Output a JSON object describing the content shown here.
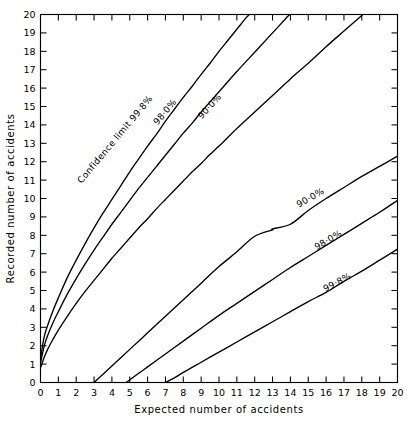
{
  "chart_data": {
    "type": "line",
    "title": "",
    "xlabel": "Expected number of accidents",
    "ylabel": "Recorded number of accidents",
    "xlim": [
      0,
      20
    ],
    "ylim": [
      0,
      20
    ],
    "xticks": [
      0,
      1,
      2,
      3,
      4,
      5,
      6,
      7,
      8,
      9,
      10,
      11,
      12,
      13,
      14,
      15,
      16,
      17,
      18,
      19,
      20
    ],
    "yticks": [
      0,
      1,
      2,
      3,
      4,
      5,
      6,
      7,
      8,
      9,
      10,
      11,
      12,
      13,
      14,
      15,
      16,
      17,
      18,
      19,
      20
    ],
    "xticklabels": [
      "0",
      "1",
      "2",
      "3",
      "4",
      "5",
      "6",
      "7",
      "8",
      "9",
      "10",
      "11",
      "12",
      "13",
      "14",
      "15",
      "16",
      "17",
      "18",
      "19",
      "20"
    ],
    "yticklabels": [
      "0",
      "1",
      "2",
      "3",
      "4",
      "5",
      "6",
      "7",
      "8",
      "9",
      "10",
      "11",
      "12",
      "13",
      "14",
      "15",
      "16",
      "17",
      "18",
      "19",
      "20"
    ],
    "grid": false,
    "legend": "none",
    "ticks_inward": true,
    "line_color": "#000000",
    "background": "#ffffff",
    "series": [
      {
        "name": "upper-99.8",
        "label": "Confidence limit 99·8%",
        "label_x": 4.3,
        "label_y": 13.1,
        "label_angle": -50,
        "points": [
          [
            0.0,
            1.3
          ],
          [
            0.2,
            2.45
          ],
          [
            0.4,
            3.1
          ],
          [
            0.7,
            3.9
          ],
          [
            1.0,
            4.6
          ],
          [
            1.5,
            5.7
          ],
          [
            2.0,
            6.65
          ],
          [
            2.5,
            7.55
          ],
          [
            3.0,
            8.4
          ],
          [
            3.5,
            9.2
          ],
          [
            4.0,
            9.95
          ],
          [
            4.5,
            10.7
          ],
          [
            5.0,
            11.45
          ],
          [
            5.5,
            12.15
          ],
          [
            6.0,
            12.85
          ],
          [
            6.5,
            13.5
          ],
          [
            7.0,
            14.2
          ],
          [
            7.5,
            14.85
          ],
          [
            8.0,
            15.5
          ],
          [
            8.5,
            16.1
          ],
          [
            9.0,
            16.75
          ],
          [
            9.5,
            17.35
          ],
          [
            10.0,
            18.0
          ],
          [
            10.5,
            18.6
          ],
          [
            11.0,
            19.2
          ],
          [
            11.5,
            19.8
          ],
          [
            11.7,
            20.0
          ]
        ]
      },
      {
        "name": "upper-98.0",
        "label": "98·0%",
        "label_x": 7.1,
        "label_y": 14.6,
        "label_angle": -50,
        "points": [
          [
            0.0,
            1.05
          ],
          [
            0.2,
            1.95
          ],
          [
            0.4,
            2.55
          ],
          [
            0.7,
            3.25
          ],
          [
            1.0,
            3.85
          ],
          [
            1.5,
            4.8
          ],
          [
            2.0,
            5.65
          ],
          [
            2.5,
            6.45
          ],
          [
            3.0,
            7.2
          ],
          [
            3.5,
            7.9
          ],
          [
            4.0,
            8.6
          ],
          [
            4.5,
            9.25
          ],
          [
            5.0,
            9.9
          ],
          [
            5.5,
            10.55
          ],
          [
            6.0,
            11.15
          ],
          [
            6.5,
            11.75
          ],
          [
            7.0,
            12.35
          ],
          [
            7.5,
            12.95
          ],
          [
            8.0,
            13.55
          ],
          [
            8.5,
            14.1
          ],
          [
            9.0,
            14.7
          ],
          [
            9.5,
            15.25
          ],
          [
            10.0,
            15.8
          ],
          [
            11.0,
            16.9
          ],
          [
            12.0,
            17.95
          ],
          [
            13.0,
            19.0
          ],
          [
            13.9,
            19.95
          ],
          [
            14.0,
            20.0
          ]
        ]
      },
      {
        "name": "upper-90.0",
        "label": "90·0%",
        "label_x": 9.6,
        "label_y": 14.9,
        "label_angle": -48,
        "points": [
          [
            0.0,
            0.8
          ],
          [
            0.2,
            1.35
          ],
          [
            0.4,
            1.8
          ],
          [
            0.7,
            2.35
          ],
          [
            1.0,
            2.85
          ],
          [
            1.5,
            3.6
          ],
          [
            2.0,
            4.3
          ],
          [
            2.5,
            4.95
          ],
          [
            3.0,
            5.55
          ],
          [
            3.5,
            6.15
          ],
          [
            4.0,
            6.75
          ],
          [
            4.5,
            7.3
          ],
          [
            5.0,
            7.85
          ],
          [
            5.5,
            8.4
          ],
          [
            6.0,
            8.9
          ],
          [
            6.5,
            9.45
          ],
          [
            7.0,
            9.95
          ],
          [
            7.5,
            10.45
          ],
          [
            8.0,
            10.95
          ],
          [
            8.5,
            11.45
          ],
          [
            9.0,
            11.9
          ],
          [
            9.5,
            12.4
          ],
          [
            10.0,
            12.85
          ],
          [
            11.0,
            13.8
          ],
          [
            12.0,
            14.7
          ],
          [
            13.0,
            15.6
          ],
          [
            14.0,
            16.5
          ],
          [
            15.0,
            17.35
          ],
          [
            16.0,
            18.25
          ],
          [
            17.0,
            19.1
          ],
          [
            18.0,
            19.95
          ],
          [
            18.05,
            20.0
          ]
        ]
      },
      {
        "name": "lower-90.0",
        "label": "90·0%",
        "label_x": 15.2,
        "label_y": 9.9,
        "label_angle": -30,
        "points": [
          [
            3.0,
            0.0
          ],
          [
            3.5,
            0.45
          ],
          [
            4.0,
            0.9
          ],
          [
            4.5,
            1.35
          ],
          [
            5.0,
            1.8
          ],
          [
            6.0,
            2.7
          ],
          [
            7.0,
            3.6
          ],
          [
            8.0,
            4.5
          ],
          [
            9.0,
            5.4
          ],
          [
            10.0,
            6.3
          ],
          [
            11.0,
            7.1
          ],
          [
            12.0,
            7.95
          ],
          [
            13.0,
            8.3
          ],
          [
            13.0,
            8.35
          ],
          [
            14.0,
            8.6
          ],
          [
            15.0,
            9.35
          ],
          [
            16.0,
            10.0
          ],
          [
            17.0,
            10.6
          ],
          [
            18.0,
            11.2
          ],
          [
            19.0,
            11.75
          ],
          [
            20.0,
            12.3
          ]
        ]
      },
      {
        "name": "lower-98.0",
        "label": "98·0%",
        "label_x": 16.2,
        "label_y": 7.6,
        "label_angle": -30,
        "points": [
          [
            4.8,
            0.0
          ],
          [
            5.5,
            0.5
          ],
          [
            6.0,
            0.85
          ],
          [
            7.0,
            1.55
          ],
          [
            8.0,
            2.25
          ],
          [
            9.0,
            2.95
          ],
          [
            10.0,
            3.65
          ],
          [
            11.0,
            4.3
          ],
          [
            12.0,
            4.95
          ],
          [
            13.0,
            5.6
          ],
          [
            14.0,
            6.25
          ],
          [
            15.0,
            6.85
          ],
          [
            16.0,
            7.45
          ],
          [
            17.0,
            8.05
          ],
          [
            18.0,
            8.65
          ],
          [
            19.0,
            9.25
          ],
          [
            20.0,
            9.9
          ]
        ]
      },
      {
        "name": "lower-99.8",
        "label": "99·8%",
        "label_x": 16.7,
        "label_y": 5.3,
        "label_angle": -28,
        "points": [
          [
            7.0,
            0.0
          ],
          [
            7.5,
            0.25
          ],
          [
            8.0,
            0.55
          ],
          [
            9.0,
            1.1
          ],
          [
            10.0,
            1.65
          ],
          [
            11.0,
            2.2
          ],
          [
            12.0,
            2.75
          ],
          [
            13.0,
            3.3
          ],
          [
            14.0,
            3.85
          ],
          [
            15.0,
            4.4
          ],
          [
            16.0,
            4.9
          ],
          [
            17.0,
            5.5
          ],
          [
            18.0,
            6.05
          ],
          [
            19.0,
            6.65
          ],
          [
            20.0,
            7.25
          ]
        ]
      }
    ]
  }
}
